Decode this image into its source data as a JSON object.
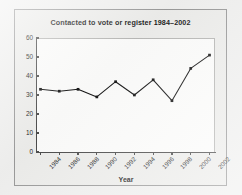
{
  "figure": {
    "background_color": "#f1f1f0",
    "panel_color": "#eeeeec",
    "plot_color": "#fdfdfc",
    "ink_color": "#151515",
    "axis_color": "#4a4a4a"
  },
  "chart_data": {
    "type": "line",
    "title": "Contacted to vote or register 1984–2002",
    "xlabel": "Year",
    "ylabel": "",
    "categories": [
      "1984",
      "1986",
      "1988",
      "1990",
      "1992",
      "1994",
      "1996",
      "1998",
      "2000",
      "2002"
    ],
    "values": [
      33,
      32,
      33,
      29,
      37,
      30,
      38,
      27,
      44,
      51
    ],
    "series": [
      {
        "name": "Contacted to vote or register",
        "values": [
          33,
          32,
          33,
          29,
          37,
          30,
          38,
          27,
          44,
          51
        ]
      }
    ],
    "ylim": [
      0,
      60
    ],
    "ytick_labels": [
      "0",
      "10",
      "20",
      "30",
      "40",
      "50",
      "60"
    ],
    "ytick_values": [
      0,
      10,
      20,
      30,
      40,
      50,
      60
    ],
    "xtick_labels": [
      "1984",
      "1986",
      "1988",
      "1990",
      "1992",
      "1994",
      "1996",
      "1998",
      "2000",
      "2002"
    ],
    "xtick_rotation": -45,
    "grid": false,
    "legend": false,
    "marker": "filled-square",
    "line_color": "#151515"
  }
}
